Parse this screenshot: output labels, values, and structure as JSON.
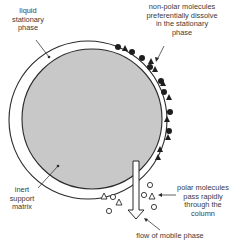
{
  "diagram": {
    "colors": {
      "support_fill": "#c8c8c8",
      "outline": "#2a2a2a",
      "stationary_band": "#ffffff",
      "text": "#3a3a3a",
      "arrow_fill": "#ffffff"
    },
    "labels": {
      "liquid_stationary_phase": [
        "liquid",
        "stationary",
        "phase"
      ],
      "non_polar": [
        "non-polar molecules",
        "preferentially dissolve",
        "in the stationary",
        "phase"
      ],
      "inert_support": [
        "inert",
        "support",
        "matrix"
      ],
      "polar": [
        "polar molecules",
        "pass rapidly",
        "through the",
        "column"
      ],
      "mobile_phase": "flow of mobile phase"
    },
    "legend_shapes": {
      "non_polar_molecules": [
        "filled-circle",
        "filled-triangle"
      ],
      "polar_molecules": [
        "open-circle",
        "open-triangle"
      ]
    }
  }
}
